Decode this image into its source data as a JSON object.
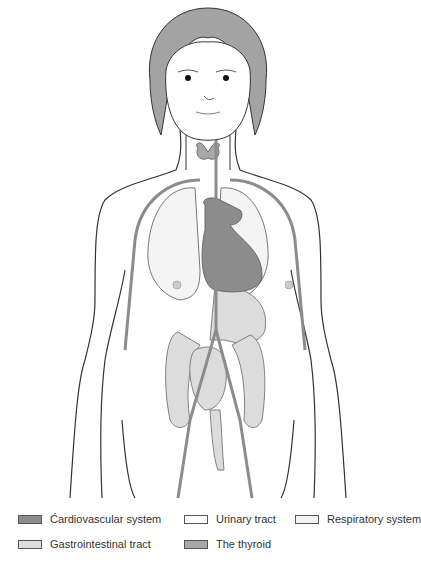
{
  "figure": {
    "colors": {
      "cardiovascular": "#8c8c8c",
      "gastrointestinal": "#dcdcdc",
      "urinary": "#ffffff",
      "respiratory": "#f4f4f4",
      "thyroid": "#a8a8a8",
      "hair": "#a3a3a3",
      "outline": "#333333"
    }
  },
  "legend": {
    "items": [
      {
        "label": "Ćardiovascular system",
        "color": "#8c8c8c"
      },
      {
        "label": "Urinary tract",
        "color": "#ffffff"
      },
      {
        "label": "Respiratory system",
        "color": "#f4f4f4"
      },
      {
        "label": "Gastrointestinal tract",
        "color": "#dcdcdc"
      },
      {
        "label": "The thyroid",
        "color": "#a8a8a8"
      }
    ]
  }
}
